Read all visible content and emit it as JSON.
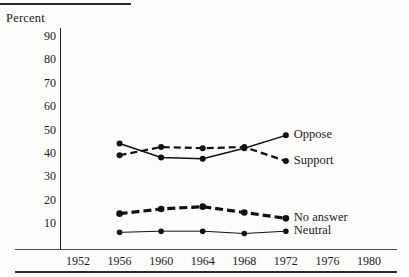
{
  "figure": {
    "ylabel": "Percent"
  },
  "chart_data": {
    "type": "line",
    "title": "",
    "xlabel": "",
    "ylabel": "Percent",
    "x": [
      1956,
      1960,
      1964,
      1968,
      1972
    ],
    "xticklabels": [
      "1952",
      "1956",
      "1960",
      "1964",
      "1968",
      "1972",
      "1976",
      "1980"
    ],
    "xticks": [
      1952,
      1956,
      1960,
      1964,
      1968,
      1972,
      1976,
      1980
    ],
    "yticklabels": [
      "90",
      "80",
      "70",
      "60",
      "50",
      "40",
      "30",
      "20",
      "10"
    ],
    "yticks": [
      90,
      80,
      70,
      60,
      50,
      40,
      30,
      20,
      10
    ],
    "xlim": [
      1950,
      1982
    ],
    "ylim": [
      2,
      95
    ],
    "grid": false,
    "legend_position": "right-inline",
    "series": [
      {
        "name": "Oppose",
        "label": "Oppose",
        "style": "solid",
        "color": "#111111",
        "values": [
          44,
          38,
          37.5,
          42,
          47.5
        ]
      },
      {
        "name": "Support",
        "label": "Support",
        "style": "dashed",
        "color": "#111111",
        "values": [
          39,
          42.5,
          42,
          42.5,
          36.5
        ]
      },
      {
        "name": "No answer",
        "label": "No answer",
        "style": "dashed-thick",
        "color": "#111111",
        "values": [
          14,
          16,
          17,
          14.5,
          12
        ]
      },
      {
        "name": "Neutral",
        "label": "Neutral",
        "style": "thin-solid",
        "color": "#111111",
        "values": [
          6,
          6.5,
          6.5,
          5.5,
          6.5
        ]
      }
    ]
  }
}
